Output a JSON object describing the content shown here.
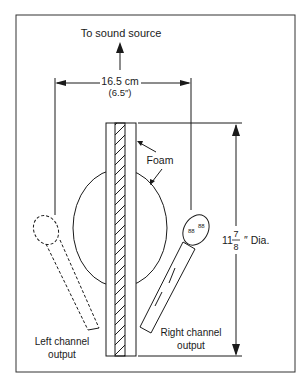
{
  "diagram": {
    "top_label": "To sound source",
    "width_dimension": {
      "metric": "16.5 cm",
      "imperial": "(6.5″)"
    },
    "foam_label": "Foam",
    "height_dimension": {
      "whole": "11",
      "numerator": "7",
      "denominator": "8",
      "suffix": "″ Dia."
    },
    "left_mic_label": [
      "Left channel",
      "output"
    ],
    "right_mic_label": [
      "Right channel",
      "output"
    ]
  },
  "colors": {
    "ink": "#1a1a1a",
    "background": "#ffffff"
  }
}
